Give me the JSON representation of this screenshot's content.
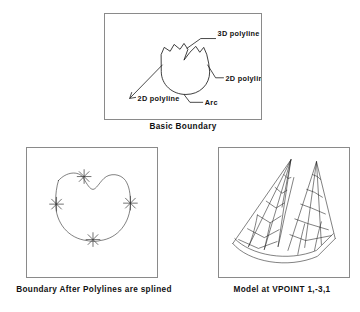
{
  "figure": {
    "background_color": "#ffffff",
    "ink_color": "#1a1a1a",
    "panel_border_color": "#8a8a8a"
  },
  "panels": [
    {
      "id": "basic-boundary",
      "caption": "Basic Boundary",
      "annotations": [
        {
          "id": "label-3d-polyline",
          "text": "3D polyline"
        },
        {
          "id": "label-2d-polyline-right",
          "text": "2D polyline"
        },
        {
          "id": "label-2d-polyline-left",
          "text": "2D polyline"
        },
        {
          "id": "label-arc",
          "text": "Arc"
        }
      ]
    },
    {
      "id": "splined-boundary",
      "caption": "Boundary After Polylines are splined",
      "vertex_marker_count": 4,
      "vertex_marker_symbol": "asterisk"
    },
    {
      "id": "model-vpoint",
      "caption": "Model at VPOINT 1,-3,1",
      "view_direction": "1,-3,1",
      "mesh_type": "wireframe-quad-surface",
      "peak_count": 2
    }
  ]
}
